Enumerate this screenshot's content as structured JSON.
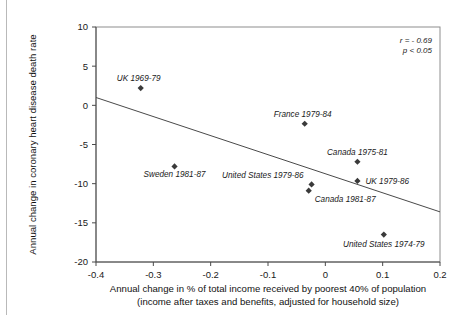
{
  "chart_data": {
    "type": "scatter",
    "title": "",
    "xlabel": "Annual change in % of total income received by poorest 40% of population",
    "xlabel_line2": "(income after taxes and benefits, adjusted for household size)",
    "ylabel": "Annual change in coronary heart disease death rate",
    "xlim": [
      -0.4,
      0.2
    ],
    "ylim": [
      -20,
      10
    ],
    "xticks": [
      "-0.4",
      "-0.3",
      "-0.2",
      "-0.1",
      "0",
      "0.1",
      "0.2"
    ],
    "xtick_values": [
      -0.4,
      -0.3,
      -0.2,
      -0.1,
      0,
      0.1,
      0.2
    ],
    "yticks": [
      "10",
      "5",
      "0",
      "-5",
      "-10",
      "-15",
      "-20"
    ],
    "ytick_values": [
      10,
      5,
      0,
      -5,
      -10,
      -15,
      -20
    ],
    "grid": false,
    "legend": "none",
    "annotations": {
      "r": "r = - 0.69",
      "p": "p < 0.05"
    },
    "trendline": {
      "x": [
        -0.4,
        0.2
      ],
      "y": [
        1.0,
        -13.6
      ]
    },
    "points": [
      {
        "label": "UK 1969-79",
        "x": -0.322,
        "y": 2.2,
        "label_dx": -2,
        "label_dy": -7,
        "anchor": "middle"
      },
      {
        "label": "Sweden 1981-87",
        "x": -0.263,
        "y": -7.8,
        "label_dx": 0,
        "label_dy": 11,
        "anchor": "middle"
      },
      {
        "label": "France 1979-84",
        "x": -0.036,
        "y": -2.35,
        "label_dx": -2,
        "label_dy": -7,
        "anchor": "middle"
      },
      {
        "label": "United States 1979-86",
        "x": -0.024,
        "y": -10.1,
        "label_dx": -8,
        "label_dy": -6,
        "anchor": "end"
      },
      {
        "label": "Canada 1981-87",
        "x": -0.029,
        "y": -10.9,
        "label_dx": 6,
        "label_dy": 11,
        "anchor": "start"
      },
      {
        "label": "Canada 1975-81",
        "x": 0.056,
        "y": -7.2,
        "label_dx": 0,
        "label_dy": -7,
        "anchor": "middle"
      },
      {
        "label": "UK 1979-86",
        "x": 0.056,
        "y": -9.65,
        "label_dx": 8,
        "label_dy": 3,
        "anchor": "start"
      },
      {
        "label": "United States 1974-79",
        "x": 0.102,
        "y": -16.5,
        "label_dx": 0,
        "label_dy": 12,
        "anchor": "middle"
      }
    ]
  }
}
